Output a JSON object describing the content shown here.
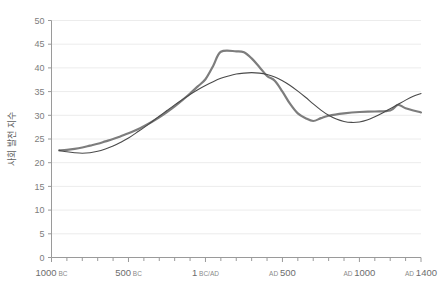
{
  "chart_data": {
    "type": "line",
    "title": "",
    "xlabel": "",
    "ylabel": "사회 발전 지수",
    "ylim": [
      0,
      50
    ],
    "ytick_values": [
      0,
      5,
      10,
      15,
      20,
      25,
      30,
      35,
      40,
      45,
      50
    ],
    "ytick_labels": [
      "0",
      "5",
      "10",
      "15",
      "20",
      "25",
      "30",
      "35",
      "40",
      "45",
      "50"
    ],
    "xlim": [
      -1000,
      1400
    ],
    "xtick_major_values": [
      -1000,
      -500,
      0,
      500,
      1000,
      1400
    ],
    "xtick_labels": [
      {
        "num": "1000",
        "era": "BC",
        "era_first": false,
        "value": -1000
      },
      {
        "num": "500",
        "era": "BC",
        "era_first": false,
        "value": -500
      },
      {
        "num": "1",
        "era": "BC/AD",
        "era_first": false,
        "value": 0
      },
      {
        "num": "500",
        "era": "AD",
        "era_first": true,
        "value": 500
      },
      {
        "num": "1000",
        "era": "AD",
        "era_first": true,
        "value": 1000
      },
      {
        "num": "1400",
        "era": "AD",
        "era_first": true,
        "value": 1400
      }
    ],
    "xtick_minor_values": [
      -900,
      -800,
      -700,
      -600,
      -400,
      -300,
      -200,
      -100,
      100,
      200,
      300,
      400,
      600,
      700,
      800,
      900,
      1100,
      1200,
      1300
    ],
    "grid": "horizontal",
    "legend_position": "none",
    "series": [
      {
        "name": "series-gray",
        "color": "#7d7d7d",
        "width": 2.2,
        "points": [
          {
            "x": -950,
            "y": 22.6
          },
          {
            "x": -900,
            "y": 22.7
          },
          {
            "x": -850,
            "y": 22.9
          },
          {
            "x": -800,
            "y": 23.2
          },
          {
            "x": -750,
            "y": 23.6
          },
          {
            "x": -700,
            "y": 24.0
          },
          {
            "x": -650,
            "y": 24.5
          },
          {
            "x": -600,
            "y": 25.0
          },
          {
            "x": -550,
            "y": 25.6
          },
          {
            "x": -500,
            "y": 26.2
          },
          {
            "x": -450,
            "y": 26.9
          },
          {
            "x": -400,
            "y": 27.7
          },
          {
            "x": -350,
            "y": 28.6
          },
          {
            "x": -300,
            "y": 29.6
          },
          {
            "x": -250,
            "y": 30.7
          },
          {
            "x": -200,
            "y": 31.9
          },
          {
            "x": -150,
            "y": 33.2
          },
          {
            "x": -100,
            "y": 34.6
          },
          {
            "x": -50,
            "y": 36.1
          },
          {
            "x": 0,
            "y": 37.6
          },
          {
            "x": 50,
            "y": 40.4
          },
          {
            "x": 100,
            "y": 43.4
          },
          {
            "x": 200,
            "y": 43.5
          },
          {
            "x": 250,
            "y": 43.3
          },
          {
            "x": 300,
            "y": 42.0
          },
          {
            "x": 350,
            "y": 40.2
          },
          {
            "x": 400,
            "y": 38.3
          },
          {
            "x": 450,
            "y": 37.3
          },
          {
            "x": 500,
            "y": 35.0
          },
          {
            "x": 550,
            "y": 32.4
          },
          {
            "x": 600,
            "y": 30.4
          },
          {
            "x": 650,
            "y": 29.4
          },
          {
            "x": 700,
            "y": 28.8
          },
          {
            "x": 750,
            "y": 29.4
          },
          {
            "x": 800,
            "y": 29.9
          },
          {
            "x": 900,
            "y": 30.4
          },
          {
            "x": 1000,
            "y": 30.7
          },
          {
            "x": 1100,
            "y": 30.8
          },
          {
            "x": 1200,
            "y": 31.0
          },
          {
            "x": 1250,
            "y": 32.2
          },
          {
            "x": 1300,
            "y": 31.5
          },
          {
            "x": 1400,
            "y": 30.6
          }
        ]
      },
      {
        "name": "series-dark",
        "color": "#4a4a4a",
        "width": 1.1,
        "points": [
          {
            "x": -950,
            "y": 22.6
          },
          {
            "x": -900,
            "y": 22.3
          },
          {
            "x": -850,
            "y": 22.1
          },
          {
            "x": -800,
            "y": 22.0
          },
          {
            "x": -750,
            "y": 22.1
          },
          {
            "x": -700,
            "y": 22.4
          },
          {
            "x": -650,
            "y": 22.9
          },
          {
            "x": -600,
            "y": 23.5
          },
          {
            "x": -550,
            "y": 24.3
          },
          {
            "x": -500,
            "y": 25.2
          },
          {
            "x": -450,
            "y": 26.3
          },
          {
            "x": -400,
            "y": 27.4
          },
          {
            "x": -350,
            "y": 28.6
          },
          {
            "x": -300,
            "y": 29.8
          },
          {
            "x": -250,
            "y": 31.0
          },
          {
            "x": -200,
            "y": 32.2
          },
          {
            "x": -150,
            "y": 33.3
          },
          {
            "x": -100,
            "y": 34.4
          },
          {
            "x": -50,
            "y": 35.4
          },
          {
            "x": 0,
            "y": 36.3
          },
          {
            "x": 50,
            "y": 37.1
          },
          {
            "x": 100,
            "y": 37.8
          },
          {
            "x": 150,
            "y": 38.3
          },
          {
            "x": 200,
            "y": 38.7
          },
          {
            "x": 250,
            "y": 38.9
          },
          {
            "x": 300,
            "y": 39.0
          },
          {
            "x": 350,
            "y": 38.9
          },
          {
            "x": 400,
            "y": 38.6
          },
          {
            "x": 450,
            "y": 38.1
          },
          {
            "x": 500,
            "y": 37.3
          },
          {
            "x": 550,
            "y": 36.3
          },
          {
            "x": 600,
            "y": 35.1
          },
          {
            "x": 650,
            "y": 33.8
          },
          {
            "x": 700,
            "y": 32.4
          },
          {
            "x": 750,
            "y": 31.1
          },
          {
            "x": 800,
            "y": 30.0
          },
          {
            "x": 850,
            "y": 29.2
          },
          {
            "x": 900,
            "y": 28.7
          },
          {
            "x": 950,
            "y": 28.5
          },
          {
            "x": 1000,
            "y": 28.6
          },
          {
            "x": 1050,
            "y": 29.0
          },
          {
            "x": 1100,
            "y": 29.7
          },
          {
            "x": 1150,
            "y": 30.5
          },
          {
            "x": 1200,
            "y": 31.4
          },
          {
            "x": 1250,
            "y": 32.3
          },
          {
            "x": 1300,
            "y": 33.2
          },
          {
            "x": 1350,
            "y": 34.0
          },
          {
            "x": 1400,
            "y": 34.6
          }
        ]
      }
    ]
  }
}
